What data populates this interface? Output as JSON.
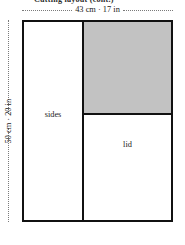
{
  "figure": {
    "cut_off_caption": "Cutting layout (cont.)",
    "dimensions": {
      "width_label": "43 cm · 17 in",
      "height_label": "50 cm · 20 in"
    },
    "regions": {
      "left_label": "sides",
      "bottom_right_label": "lid",
      "top_right_label": ""
    },
    "colors": {
      "shaded_fill": "#c2c2c2",
      "stroke": "#111111",
      "background": "#ffffff",
      "leader_line": "#7a7a7a"
    }
  }
}
